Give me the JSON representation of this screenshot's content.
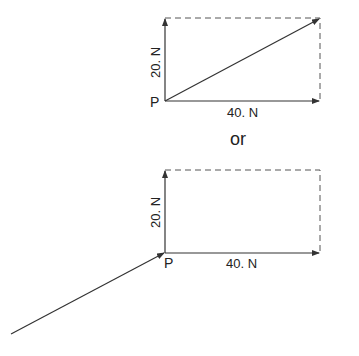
{
  "diagram": {
    "top": {
      "point_label": "P",
      "vertical_label": "20. N",
      "horizontal_label": "40. N"
    },
    "separator": "or",
    "bottom": {
      "point_label": "P",
      "vertical_label": "20. N",
      "horizontal_label": "40. N"
    },
    "colors": {
      "line": "#333333",
      "dashed": "#555555",
      "text": "#222222"
    }
  }
}
